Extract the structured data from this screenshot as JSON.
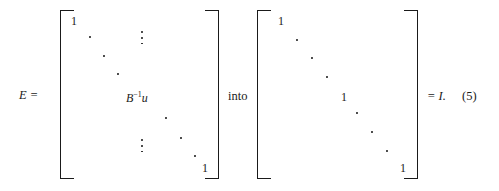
{
  "figure": {
    "kind": "display-equation",
    "equation_number": "(5)",
    "lhs_label": "E =",
    "connector": "into",
    "rhs_label": "= I.",
    "ink_color": "#1a1a1a",
    "background_color": "#ffffff"
  },
  "matrix_e": {
    "name": "E",
    "entries": {
      "top_left_one": "1",
      "bottom_right_one": "1",
      "column_vector": {
        "base": "B",
        "exponent": "−1",
        "vector": "u"
      }
    },
    "vertical_ellipsis_upper": "⋮",
    "vertical_ellipsis_lower": "⋮",
    "diagonal_dots_upper_count": 3,
    "diagonal_dots_lower_count": 3
  },
  "matrix_b": {
    "entries": {
      "top_left_one": "1",
      "middle_one": "1",
      "bottom_right_one": "1"
    },
    "diagonal_dots_upper_count": 3,
    "diagonal_dots_lower_count": 3
  }
}
